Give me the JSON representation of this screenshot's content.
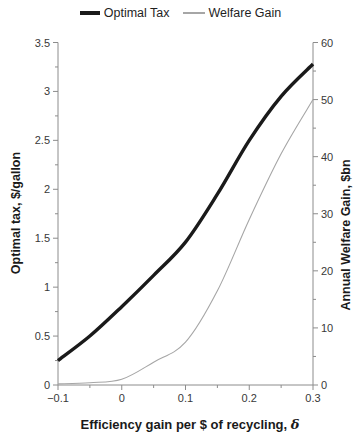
{
  "legend": {
    "items": [
      {
        "label": "Optimal Tax",
        "color": "#1a1a1a",
        "thickness": 3.6
      },
      {
        "label": "Welfare Gain",
        "color": "#a6a6a6",
        "thickness": 1.2
      }
    ]
  },
  "chart_data": {
    "type": "line",
    "title": "",
    "x": [
      -0.1,
      -0.05,
      0,
      0.05,
      0.1,
      0.15,
      0.2,
      0.25,
      0.3
    ],
    "series": [
      {
        "name": "Optimal Tax",
        "axis": "left",
        "color": "#1a1a1a",
        "width": 3.4,
        "values": [
          0.25,
          0.5,
          0.8,
          1.12,
          1.46,
          1.95,
          2.5,
          2.95,
          3.28
        ]
      },
      {
        "name": "Welfare Gain",
        "axis": "right",
        "color": "#a6a6a6",
        "width": 1.1,
        "values": [
          0.2,
          0.4,
          1.0,
          4.0,
          7.5,
          16.5,
          29,
          40.5,
          50
        ]
      }
    ],
    "x_axis": {
      "label": "Efficiency gain per $ of recycling, δ",
      "label_text": "Efficiency gain per $ of recycling, ",
      "label_symbol": "δ",
      "range": [
        -0.1,
        0.3
      ],
      "ticks": [
        -0.1,
        0,
        0.1,
        0.2,
        0.3
      ],
      "tick_labels": [
        "−0.1",
        "0",
        "0.1",
        "0.2",
        "0.3"
      ],
      "minor_step": 0.05
    },
    "left_axis": {
      "label": "Optimal tax, $/gallon",
      "range": [
        0,
        3.5
      ],
      "ticks": [
        0,
        0.5,
        1,
        1.5,
        2,
        2.5,
        3,
        3.5
      ],
      "tick_labels": [
        "0",
        "0.5",
        "1",
        "1.5",
        "2",
        "2.5",
        "3",
        "3.5"
      ],
      "minor_step": 0.25
    },
    "right_axis": {
      "label": "Annual Welfare Gain, $bn",
      "range": [
        0,
        60
      ],
      "ticks": [
        0,
        10,
        20,
        30,
        40,
        50,
        60
      ],
      "tick_labels": [
        "0",
        "10",
        "20",
        "30",
        "40",
        "50",
        "60"
      ],
      "minor_step": 5
    },
    "grid": false,
    "legend_position": "top"
  },
  "colors": {
    "background": "#ffffff",
    "axis": "#8c8c8c",
    "text": "#383838"
  }
}
